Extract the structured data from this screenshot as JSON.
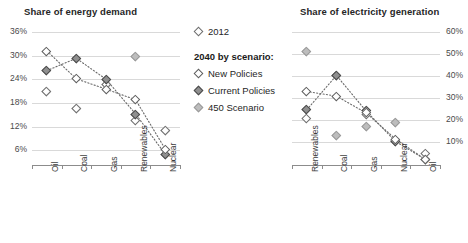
{
  "legend": {
    "heading": "2040 by scenario:",
    "entries": [
      {
        "label": "2012",
        "key": "2012",
        "style": "open"
      },
      {
        "label": "New Policies",
        "key": "new",
        "style": "open"
      },
      {
        "label": "Current Policies",
        "key": "current",
        "style": "dark"
      },
      {
        "label": "450 Scenario",
        "key": "450",
        "style": "light"
      }
    ]
  },
  "chart_data": [
    {
      "type": "scatter",
      "title": "Share of energy demand",
      "xlabel": "",
      "ylabel": "",
      "categories": [
        "Oil",
        "Coal",
        "Gas",
        "Renewables",
        "Nuclear"
      ],
      "ylim": [
        3,
        36
      ],
      "yticks": [
        36,
        30,
        24,
        18,
        12,
        6
      ],
      "ytick_labels": [
        "36%",
        "30%",
        "24%",
        "18%",
        "12%",
        "6%"
      ],
      "y_axis_position": "left",
      "grid": true,
      "legend_position": "center",
      "series": [
        {
          "name": "2012",
          "key": "2012",
          "connected": false,
          "values": [
            21.0,
            16.5,
            22.8,
            13.5,
            11.0
          ]
        },
        {
          "name": "New Policies",
          "key": "new",
          "connected": true,
          "values": [
            31.2,
            24.1,
            21.5,
            18.8,
            6.3
          ]
        },
        {
          "name": "Current Policies",
          "key": "current",
          "connected": true,
          "values": [
            26.2,
            29.3,
            24.0,
            15.2,
            5.0
          ]
        },
        {
          "name": "450 Scenario",
          "key": "450",
          "connected": false,
          "values": [
            21.0,
            16.5,
            22.8,
            29.9,
            11.0
          ]
        }
      ]
    },
    {
      "type": "scatter",
      "title": "Share of electricity generation",
      "xlabel": "",
      "ylabel": "",
      "categories": [
        "Renewables",
        "Coal",
        "Gas",
        "Nuclear",
        "Oil"
      ],
      "ylim": [
        1,
        60
      ],
      "yticks": [
        60,
        50,
        40,
        30,
        20,
        10
      ],
      "ytick_labels": [
        "60%",
        "50%",
        "40%",
        "30%",
        "20%",
        "10%"
      ],
      "y_axis_position": "right",
      "grid": true,
      "legend_position": "center",
      "series": [
        {
          "name": "2012",
          "key": "2012",
          "connected": false,
          "values": [
            20.8,
            40.5,
            22.6,
            10.8,
            4.8
          ]
        },
        {
          "name": "New Policies",
          "key": "new",
          "connected": true,
          "values": [
            33.0,
            30.9,
            23.3,
            11.4,
            2.2
          ]
        },
        {
          "name": "Current Policies",
          "key": "current",
          "connected": true,
          "values": [
            24.7,
            40.3,
            24.2,
            10.3,
            2.2
          ]
        },
        {
          "name": "450 Scenario",
          "key": "450",
          "connected": false,
          "values": [
            51.0,
            13.0,
            17.2,
            18.9,
            2.2
          ]
        }
      ]
    }
  ]
}
